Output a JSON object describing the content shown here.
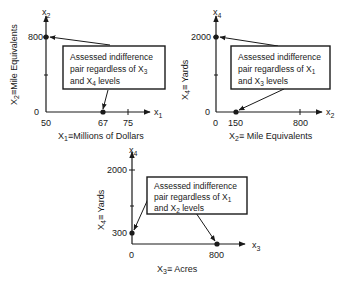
{
  "panels": [
    {
      "id": "x1-x2",
      "y_axis_symbol": "x",
      "y_axis_sub": "2",
      "x_axis_symbol": "x",
      "x_axis_sub": "1",
      "y_label_main": "X",
      "y_label_sub": "2",
      "y_label_rest": "≡Mile Equivalents",
      "x_label_main": "X",
      "x_label_sub": "1",
      "x_label_rest": "≡Millions of Dollars",
      "y_ticks": [
        "800",
        "0"
      ],
      "x_ticks": [
        "50",
        "67",
        "75"
      ],
      "box_line1": "Assessed indifference",
      "box_line2a": "pair regardless of X",
      "box_line2sub": "3",
      "box_line3a": "and X",
      "box_line3sub": "4",
      "box_line3b": " levels",
      "points": [
        {
          "x": 50,
          "y": 800
        },
        {
          "x": 67,
          "y": 0
        }
      ]
    },
    {
      "id": "x2-x4",
      "y_axis_symbol": "x",
      "y_axis_sub": "4",
      "x_axis_symbol": "x",
      "x_axis_sub": "2",
      "y_label_main": "X",
      "y_label_sub": "4",
      "y_label_rest": "≡ Yards",
      "x_label_main": "X",
      "x_label_sub": "2",
      "x_label_rest": "≡ Mile Equivalents",
      "y_ticks": [
        "2000",
        "0"
      ],
      "x_ticks": [
        "0",
        "150",
        "800"
      ],
      "box_line1": "Assessed indifference",
      "box_line2a": "pair regardless of X",
      "box_line2sub": "1",
      "box_line3a": "and X",
      "box_line3sub": "3",
      "box_line3b": " levels",
      "points": [
        {
          "x": 0,
          "y": 2000
        },
        {
          "x": 150,
          "y": 0
        }
      ]
    },
    {
      "id": "x3-x4",
      "y_axis_symbol": "x",
      "y_axis_sub": "4",
      "x_axis_symbol": "x",
      "x_axis_sub": "3",
      "y_label_main": "X",
      "y_label_sub": "4",
      "y_label_rest": "≡ Yards",
      "x_label_main": "X",
      "x_label_sub": "3",
      "x_label_rest": "≡ Acres",
      "y_ticks": [
        "2000",
        "300"
      ],
      "x_ticks": [
        "0",
        "800"
      ],
      "box_line1": "Assessed indifference",
      "box_line2a": "pair regardless of X",
      "box_line2sub": "1",
      "box_line3a": "and X",
      "box_line3sub": "2",
      "box_line3b": " levels",
      "points": [
        {
          "x": 0,
          "y": 300
        },
        {
          "x": 800,
          "y": 0
        }
      ]
    }
  ],
  "colors": {
    "ink": "#1a1a1a",
    "background": "#ffffff"
  }
}
